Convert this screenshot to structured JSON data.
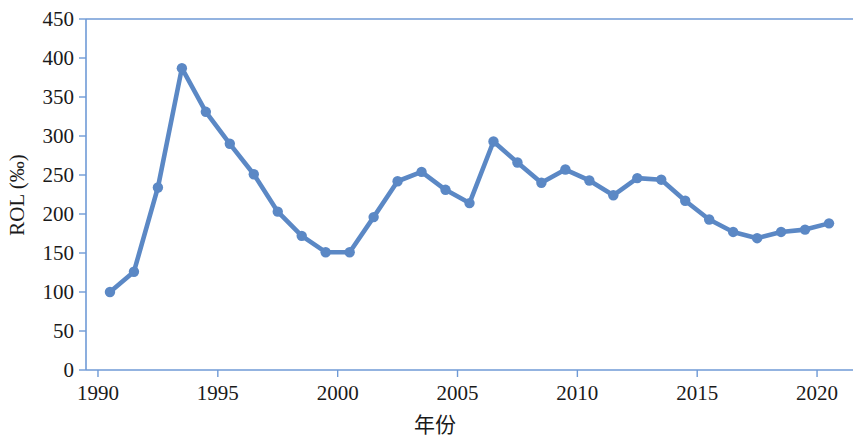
{
  "chart_data": {
    "type": "line",
    "title": "",
    "subtitle": "",
    "xlabel": "年份",
    "ylabel": "ROL (‰)",
    "xlim": [
      1989.5,
      2021.5
    ],
    "ylim": [
      0,
      450
    ],
    "xticks": [
      1990,
      1995,
      2000,
      2005,
      2010,
      2015,
      2020
    ],
    "xtick_labels": [
      "1990",
      "1995",
      "2000",
      "2005",
      "2010",
      "2015",
      "2020"
    ],
    "yticks": [
      0,
      50,
      100,
      150,
      200,
      250,
      300,
      350,
      400,
      450
    ],
    "ytick_labels": [
      "0",
      "50",
      "100",
      "150",
      "200",
      "250",
      "300",
      "350",
      "400",
      "450"
    ],
    "grid": false,
    "legend": null,
    "series": [
      {
        "name": "ROL",
        "color": "#5b88c5",
        "marker": "circle",
        "x": [
          1990.5,
          1991.5,
          1992.5,
          1993.5,
          1994.5,
          1995.5,
          1996.5,
          1997.5,
          1998.5,
          1999.5,
          2000.5,
          2001.5,
          2002.5,
          2003.5,
          2004.5,
          2005.5,
          2006.5,
          2007.5,
          2008.5,
          2009.5,
          2010.5,
          2011.5,
          2012.5,
          2013.5,
          2014.5,
          2015.5,
          2016.5,
          2017.5,
          2018.5,
          2019.5,
          2020.5
        ],
        "values": [
          100,
          126,
          234,
          387,
          331,
          290,
          251,
          203,
          172,
          151,
          151,
          196,
          242,
          254,
          231,
          214,
          293,
          266,
          240,
          257,
          243,
          224,
          246,
          244,
          217,
          193,
          177,
          169,
          177,
          180,
          188
        ]
      }
    ]
  },
  "axes": {
    "y_axis_title": "ROL (‰)",
    "x_axis_title": "年份"
  },
  "style": {
    "line_color": "#5b88c5",
    "axis_color": "#6f9ad6",
    "text_color": "#1a1a1a",
    "background": "#ffffff"
  }
}
